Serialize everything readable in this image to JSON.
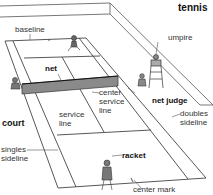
{
  "title": "tennis",
  "labels": {
    "baseline": "baseline",
    "net": "net",
    "umpire": "umpire",
    "net_judge": "net judge",
    "center_service_line_1": "center",
    "center_service_line_2": "service",
    "center_service_line_3": "line",
    "service_line_1": "service",
    "service_line_2": "line",
    "court": "court",
    "singles_sideline_1": "singles",
    "singles_sideline_2": "sideline",
    "doubles_sideline_1": "doubles",
    "doubles_sideline_2": "sideline",
    "racket": "racket",
    "center_mark": "center mark"
  },
  "colors": {
    "line": "#444444",
    "court_fill": "#ffffff",
    "net_fill": "#8a8a8a"
  }
}
